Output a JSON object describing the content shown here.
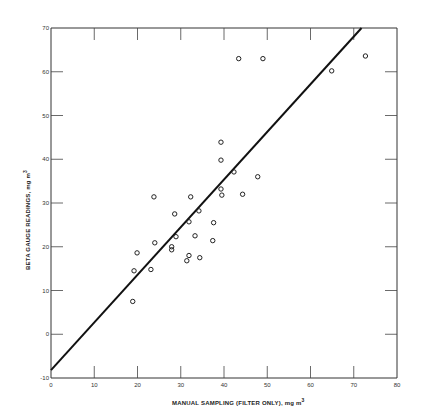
{
  "chart_data": {
    "type": "scatter",
    "title": "",
    "xlabel": "MANUAL SAMPLING (FILTER ONLY), mg m³",
    "ylabel": "BETA GAUGE READINGS, mg m³",
    "xlim": [
      0,
      80
    ],
    "ylim": [
      -10,
      70
    ],
    "x_ticks": [
      0,
      10,
      20,
      30,
      40,
      50,
      60,
      70,
      80
    ],
    "y_ticks": [
      -10,
      0,
      10,
      20,
      30,
      40,
      50,
      60,
      70
    ],
    "grid": false,
    "legend": null,
    "series": [
      {
        "name": "observations",
        "marker": "open-circle",
        "points": [
          [
            43.4,
            63.0
          ],
          [
            49.0,
            63.0
          ],
          [
            64.9,
            60.2
          ],
          [
            72.7,
            63.6
          ],
          [
            39.3,
            43.9
          ],
          [
            39.3,
            39.8
          ],
          [
            42.3,
            37.1
          ],
          [
            47.8,
            36.0
          ],
          [
            39.3,
            33.2
          ],
          [
            39.5,
            31.8
          ],
          [
            44.3,
            32.0
          ],
          [
            23.8,
            31.4
          ],
          [
            32.3,
            31.4
          ],
          [
            28.6,
            27.5
          ],
          [
            34.2,
            28.2
          ],
          [
            31.9,
            25.7
          ],
          [
            37.6,
            25.5
          ],
          [
            28.9,
            22.3
          ],
          [
            33.3,
            22.5
          ],
          [
            37.4,
            21.4
          ],
          [
            24.0,
            20.9
          ],
          [
            27.9,
            20.0
          ],
          [
            27.9,
            19.3
          ],
          [
            19.9,
            18.6
          ],
          [
            31.9,
            18.0
          ],
          [
            31.4,
            16.8
          ],
          [
            34.4,
            17.5
          ],
          [
            19.2,
            14.5
          ],
          [
            23.1,
            14.8
          ],
          [
            18.9,
            7.5
          ]
        ]
      },
      {
        "name": "regression line",
        "type": "line",
        "points": [
          [
            0,
            -8.2
          ],
          [
            71.8,
            70
          ]
        ]
      }
    ]
  },
  "labels": {
    "xlabel": "MANUAL SAMPLING (FILTER ONLY), mg m",
    "ylabel": "BETA GAUGE READINGS, mg m",
    "unit_sup": "3"
  }
}
